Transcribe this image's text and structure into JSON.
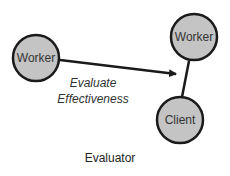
{
  "diagram": {
    "nodes": [
      {
        "id": "worker-left",
        "label": "Worker"
      },
      {
        "id": "worker-right",
        "label": "Worker"
      },
      {
        "id": "client",
        "label": "Client"
      }
    ],
    "edges": [
      {
        "from": "worker-left",
        "to": "worker-right",
        "label_line1": "Evaluate",
        "label_line2": "Effectiveness",
        "arrow": true
      },
      {
        "from": "worker-right",
        "to": "client",
        "arrow": false
      }
    ],
    "caption": "Evaluator",
    "colors": {
      "node_fill": "#c4c4c4",
      "node_stroke": "#1a1a1a",
      "edge": "#1a1a1a"
    }
  }
}
